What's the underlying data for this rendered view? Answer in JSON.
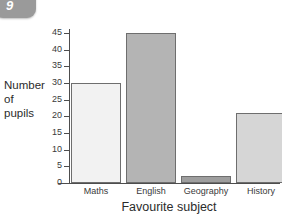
{
  "badge": {
    "number": "9",
    "color": "#9a9a9a"
  },
  "chart_data": {
    "type": "bar",
    "title": "",
    "subtitle": "",
    "xlabel": "Favourite subject",
    "ylabel": "Number of pupils",
    "ylabel_lines": [
      "Number",
      "of",
      "pupils"
    ],
    "categories": [
      "Maths",
      "English",
      "Geography",
      "History"
    ],
    "values": [
      30,
      45,
      2,
      21
    ],
    "series": [
      {
        "name": "Number of pupils",
        "values": [
          30,
          45,
          2,
          21
        ]
      }
    ],
    "bar_colors": [
      "#f2f2f2",
      "#b4b4b4",
      "#9e9e9e",
      "#d6d6d6"
    ],
    "bar_border_color": "#6e6e6e",
    "ylim": [
      0,
      45
    ],
    "ytick_step": 5,
    "ytick_labels": [
      "0",
      "5",
      "10",
      "15",
      "20",
      "25",
      "30",
      "35",
      "40",
      "45"
    ],
    "ytick_values": [
      0,
      5,
      10,
      15,
      20,
      25,
      30,
      35,
      40,
      45
    ],
    "grid": false,
    "legend": false,
    "legend_position": "none",
    "axis_color": "#4d4d4d"
  }
}
